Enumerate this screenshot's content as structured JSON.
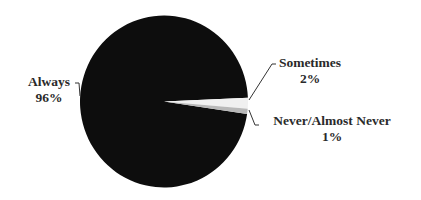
{
  "chart_data": {
    "type": "pie",
    "title": "",
    "slices": [
      {
        "label": "Always",
        "value": 96,
        "display": "96%",
        "color": "#0d0d0d"
      },
      {
        "label": "Sometimes",
        "value": 2,
        "display": "2%",
        "color": "#f0f0f0"
      },
      {
        "label": "Never/Almost Never",
        "value": 1,
        "display": "1%",
        "color": "#b8b8b8"
      }
    ],
    "legend": "none",
    "labels_position": "outside with leader lines"
  },
  "labels": {
    "always": {
      "name": "Always",
      "pct": "96%"
    },
    "sometimes": {
      "name": "Sometimes",
      "pct": "2%"
    },
    "never": {
      "name": "Never/Almost Never",
      "pct": "1%"
    }
  }
}
